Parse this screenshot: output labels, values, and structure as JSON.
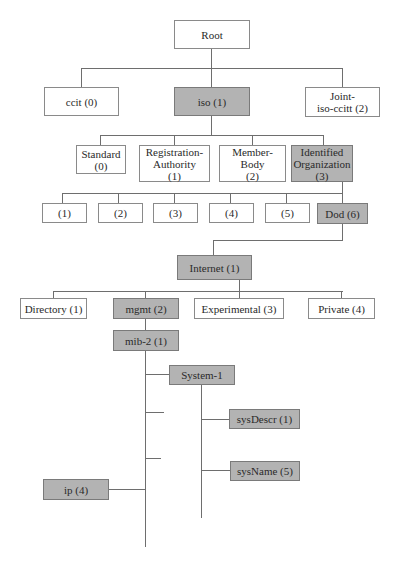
{
  "diagram": {
    "title": "",
    "type": "tree",
    "highlight_color": "#b3b3b3",
    "nodes": {
      "root": {
        "label": "Root",
        "highlighted": false
      },
      "ccit": {
        "label": "ccit (0)",
        "highlighted": false
      },
      "iso": {
        "label": "iso (1)",
        "highlighted": true
      },
      "joint": {
        "label": "Joint-\niso-ccitt (2)",
        "highlighted": false
      },
      "standard": {
        "label": "Standard\n(0)",
        "highlighted": false
      },
      "registration": {
        "label": "Registration-\nAuthority\n(1)",
        "highlighted": false
      },
      "member": {
        "label": "Member-\nBody\n(2)",
        "highlighted": false
      },
      "identified": {
        "label": "Identified\nOrganization\n(3)",
        "highlighted": true
      },
      "n1": {
        "label": "(1)",
        "highlighted": false
      },
      "n2": {
        "label": "(2)",
        "highlighted": false
      },
      "n3": {
        "label": "(3)",
        "highlighted": false
      },
      "n4": {
        "label": "(4)",
        "highlighted": false
      },
      "n5": {
        "label": "(5)",
        "highlighted": false
      },
      "dod": {
        "label": "Dod (6)",
        "highlighted": true
      },
      "internet": {
        "label": "Internet (1)",
        "highlighted": true
      },
      "directory": {
        "label": "Directory (1)",
        "highlighted": false
      },
      "mgmt": {
        "label": "mgmt (2)",
        "highlighted": true
      },
      "experimental": {
        "label": "Experimental (3)",
        "highlighted": false
      },
      "private": {
        "label": "Private (4)",
        "highlighted": false
      },
      "mib2": {
        "label": "mib-2 (1)",
        "highlighted": true
      },
      "system": {
        "label": "System-1",
        "highlighted": true
      },
      "sysdescr": {
        "label": "sysDescr (1)",
        "highlighted": true
      },
      "sysname": {
        "label": "sysName (5)",
        "highlighted": true
      },
      "ip": {
        "label": "ip (4)",
        "highlighted": true
      }
    },
    "edges": [
      [
        "root",
        "ccit"
      ],
      [
        "root",
        "iso"
      ],
      [
        "root",
        "joint"
      ],
      [
        "iso",
        "standard"
      ],
      [
        "iso",
        "registration"
      ],
      [
        "iso",
        "member"
      ],
      [
        "iso",
        "identified"
      ],
      [
        "identified",
        "n1"
      ],
      [
        "identified",
        "n2"
      ],
      [
        "identified",
        "n3"
      ],
      [
        "identified",
        "n4"
      ],
      [
        "identified",
        "n5"
      ],
      [
        "identified",
        "dod"
      ],
      [
        "dod",
        "internet"
      ],
      [
        "internet",
        "directory"
      ],
      [
        "internet",
        "mgmt"
      ],
      [
        "internet",
        "experimental"
      ],
      [
        "internet",
        "private"
      ],
      [
        "mgmt",
        "mib2"
      ],
      [
        "mib2",
        "system"
      ],
      [
        "mib2",
        "ip"
      ],
      [
        "system",
        "sysdescr"
      ],
      [
        "system",
        "sysname"
      ]
    ]
  }
}
